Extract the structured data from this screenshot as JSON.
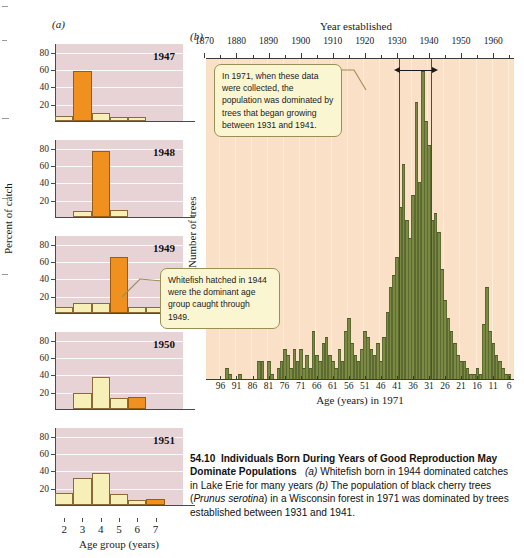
{
  "panel_a": {
    "tag": "(a)",
    "ylabel": "Percent of catch",
    "xlabel": "Age group (years)",
    "ytick_labels": [
      "80",
      "60",
      "40",
      "20"
    ],
    "xtick_labels": [
      "2",
      "3",
      "4",
      "5",
      "6",
      "7"
    ],
    "callout": "Whitefish hatched in 1944 were the dominant age group caught through 1949.",
    "colors": {
      "plot_background": "#e7d3d6",
      "gridline": "#ffffff",
      "bar_cream": "#f7efb8",
      "bar_highlight": "#f0911f",
      "callout_background": "#fbf6d2"
    },
    "charts": [
      {
        "year": "1947",
        "ages": [
          2,
          3,
          4,
          5,
          6
        ],
        "values": [
          6,
          58,
          9,
          5,
          5
        ],
        "highlight_age": 3
      },
      {
        "year": "1948",
        "ages": [
          3,
          4,
          5
        ],
        "values": [
          7,
          76,
          8
        ],
        "highlight_age": 4
      },
      {
        "year": "1949",
        "ages": [
          2,
          3,
          4,
          5,
          6,
          7,
          8
        ],
        "values": [
          7,
          11,
          11,
          65,
          7,
          7,
          7
        ],
        "highlight_age": 5
      },
      {
        "year": "1950",
        "ages": [
          3,
          4,
          5,
          6
        ],
        "values": [
          19,
          37,
          13,
          14
        ],
        "highlight_age": 6
      },
      {
        "year": "1951",
        "ages": [
          2,
          3,
          4,
          5,
          6,
          7
        ],
        "values": [
          14,
          31,
          37,
          13,
          6,
          7
        ],
        "highlight_age": 7
      }
    ]
  },
  "panel_b": {
    "tag": "(b)",
    "top_title": "Year established",
    "ylabel": "Number of trees",
    "xlabel": "Age (years) in 1971",
    "top_tick_labels": [
      "1870",
      "1880",
      "1890",
      "1900",
      "1910",
      "1920",
      "1930",
      "1940",
      "1950",
      "1960"
    ],
    "bottom_tick_labels": [
      "96",
      "91",
      "86",
      "81",
      "76",
      "71",
      "66",
      "61",
      "56",
      "51",
      "46",
      "41",
      "36",
      "31",
      "26",
      "21",
      "16",
      "11",
      "6"
    ],
    "callout": "In 1971, when these data were collected, the population was dominated by trees that began growing between 1931 and 1941.",
    "reference_years": [
      "1931",
      "1941"
    ],
    "colors": {
      "plot_background": "#fae0c6",
      "bar": "#7a8a43",
      "reference_line": "#4a4a4a",
      "callout_background": "#fbf6d2"
    }
  },
  "chart_data": [
    {
      "type": "bar",
      "title": "(a) Whitefish catch 1947",
      "xlabel": "Age group (years)",
      "ylabel": "Percent of catch",
      "ylim": [
        0,
        90
      ],
      "categories": [
        "2",
        "3",
        "4",
        "5",
        "6"
      ],
      "values": [
        6,
        58,
        9,
        5,
        5
      ],
      "highlight_category": "3",
      "grid": true,
      "legend": "none"
    },
    {
      "type": "bar",
      "title": "(a) Whitefish catch 1948",
      "xlabel": "Age group (years)",
      "ylabel": "Percent of catch",
      "ylim": [
        0,
        90
      ],
      "categories": [
        "3",
        "4",
        "5"
      ],
      "values": [
        7,
        76,
        8
      ],
      "highlight_category": "4",
      "grid": true,
      "legend": "none"
    },
    {
      "type": "bar",
      "title": "(a) Whitefish catch 1949",
      "xlabel": "Age group (years)",
      "ylabel": "Percent of catch",
      "ylim": [
        0,
        90
      ],
      "categories": [
        "2",
        "3",
        "4",
        "5",
        "6",
        "7",
        "8"
      ],
      "values": [
        7,
        11,
        11,
        65,
        7,
        7,
        7
      ],
      "highlight_category": "5",
      "grid": true,
      "legend": "none"
    },
    {
      "type": "bar",
      "title": "(a) Whitefish catch 1950",
      "xlabel": "Age group (years)",
      "ylabel": "Percent of catch",
      "ylim": [
        0,
        90
      ],
      "categories": [
        "3",
        "4",
        "5",
        "6"
      ],
      "values": [
        19,
        37,
        13,
        14
      ],
      "highlight_category": "6",
      "grid": true,
      "legend": "none"
    },
    {
      "type": "bar",
      "title": "(a) Whitefish catch 1951",
      "xlabel": "Age group (years)",
      "ylabel": "Percent of catch",
      "ylim": [
        0,
        90
      ],
      "categories": [
        "2",
        "3",
        "4",
        "5",
        "6",
        "7"
      ],
      "values": [
        14,
        31,
        37,
        13,
        6,
        7
      ],
      "highlight_category": "7",
      "grid": true,
      "legend": "none"
    },
    {
      "type": "bar",
      "title": "(b) Black cherry age structure, Wisconsin forest 1971",
      "xlabel": "Age (years) in 1971",
      "ylabel": "Number of trees",
      "x_top_label": "Year established",
      "grid": true,
      "legend": "none",
      "ages": [
        100,
        99,
        98,
        97,
        96,
        95,
        94,
        93,
        92,
        91,
        90,
        89,
        88,
        87,
        86,
        85,
        84,
        83,
        82,
        81,
        80,
        79,
        78,
        77,
        76,
        75,
        74,
        73,
        72,
        71,
        70,
        69,
        68,
        67,
        66,
        65,
        64,
        63,
        62,
        61,
        60,
        59,
        58,
        57,
        56,
        55,
        54,
        53,
        52,
        51,
        50,
        49,
        48,
        47,
        46,
        45,
        44,
        43,
        42,
        41,
        40,
        39,
        38,
        37,
        36,
        35,
        34,
        33,
        32,
        31,
        30,
        29,
        28,
        27,
        26,
        25,
        24,
        23,
        22,
        21,
        20,
        19,
        18,
        17,
        16,
        15,
        14,
        13,
        12,
        11,
        10,
        9,
        8,
        7,
        6,
        5
      ],
      "values": [
        0,
        0,
        0,
        0,
        0,
        0,
        2,
        1,
        0,
        0,
        1,
        0,
        0,
        0,
        0,
        0,
        3,
        3,
        0,
        3,
        1,
        0,
        2,
        3,
        5,
        4,
        2,
        5,
        3,
        5,
        2,
        4,
        2,
        8,
        4,
        3,
        6,
        7,
        4,
        3,
        2,
        5,
        3,
        8,
        10,
        6,
        4,
        3,
        5,
        8,
        7,
        5,
        4,
        6,
        3,
        7,
        11,
        15,
        17,
        20,
        28,
        35,
        26,
        23,
        30,
        45,
        32,
        50,
        42,
        38,
        26,
        27,
        24,
        18,
        13,
        10,
        8,
        6,
        4,
        3,
        3,
        2,
        1,
        1,
        2,
        1,
        9,
        15,
        8,
        6,
        4,
        3,
        2,
        1,
        1,
        0
      ]
    }
  ],
  "caption": {
    "number": "54.10",
    "title": "Individuals Born During Years of Good Reproduction May Dominate Populations",
    "part_a_tag": "(a)",
    "part_a_text": "Whitefish born in 1944 dominated catches in Lake Erie for many years",
    "part_b_tag": "(b)",
    "part_b_text_1": "The population of black cherry trees (",
    "part_b_species": "Prunus serotina",
    "part_b_text_2": ") in a Wisconsin forest in 1971 was dominated by trees established between 1931 and 1941."
  }
}
